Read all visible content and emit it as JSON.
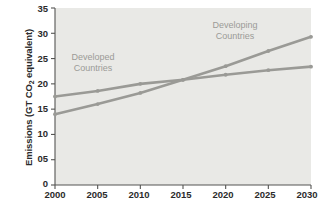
{
  "chart_data": {
    "type": "line",
    "title": "",
    "xlabel": "",
    "ylabel": "Emissions (GT CO2 equivalent)",
    "ylabel_prefix": "Emissions (GT CO",
    "ylabel_sub": "2",
    "ylabel_suffix": " equivalent)",
    "x": [
      2000,
      2005,
      2010,
      2015,
      2020,
      2025,
      2030
    ],
    "xtick_labels": [
      "2000",
      "2005",
      "2010",
      "2015",
      "2020",
      "2025",
      "2030"
    ],
    "ytick_labels": [
      "35",
      "30",
      "25",
      "20",
      "15",
      "10",
      "05",
      "0"
    ],
    "ytick_values": [
      35,
      30,
      25,
      20,
      15,
      10,
      5,
      0
    ],
    "xlim": [
      2000,
      2030
    ],
    "ylim": [
      0,
      35
    ],
    "grid": false,
    "legend_position": "inline-annotations",
    "series": [
      {
        "name": "Developed Countries",
        "color": "#9a9a96",
        "values": [
          17.5,
          18.6,
          20.0,
          20.8,
          21.8,
          22.7,
          23.4
        ]
      },
      {
        "name": "Developing Countries",
        "color": "#9a9a96",
        "values": [
          14.0,
          16.0,
          18.2,
          20.8,
          23.5,
          26.5,
          29.3
        ]
      }
    ],
    "annotations": [
      {
        "name": "Developed",
        "line1": "Developed",
        "line2": "Countries",
        "color": "#9b9b97"
      },
      {
        "name": "Developing",
        "line1": "Developing",
        "line2": "Countries",
        "color": "#9b9b97"
      }
    ],
    "plot_background": "#e9e9e6",
    "axis_color": "#555553",
    "tick_text_color": "#2b2b2b"
  }
}
